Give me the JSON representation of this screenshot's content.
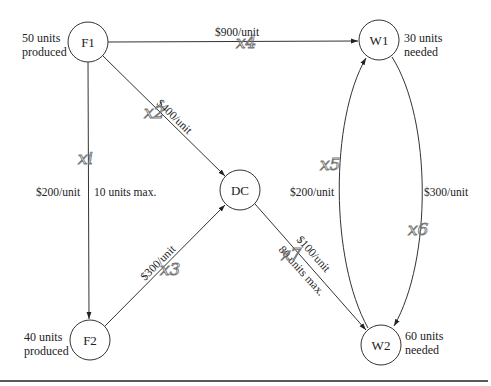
{
  "diagram": {
    "type": "transportation-network",
    "nodes": [
      {
        "id": "F1",
        "label": "F1",
        "cx": 88,
        "cy": 42,
        "note_line1": "50 units",
        "note_line2": "produced"
      },
      {
        "id": "F2",
        "label": "F2",
        "cx": 90,
        "cy": 340,
        "note_line1": "40 units",
        "note_line2": "produced"
      },
      {
        "id": "DC",
        "label": "DC",
        "cx": 240,
        "cy": 190
      },
      {
        "id": "W1",
        "label": "W1",
        "cx": 379,
        "cy": 40,
        "note_line1": "30 units",
        "note_line2": "needed"
      },
      {
        "id": "W2",
        "label": "W2",
        "cx": 381,
        "cy": 345,
        "note_line1": "60 units",
        "note_line2": "needed"
      }
    ],
    "edges": [
      {
        "from": "F1",
        "to": "W1",
        "cost": "$900/unit",
        "variable": "x4"
      },
      {
        "from": "F1",
        "to": "DC",
        "cost": "$400/unit",
        "variable": "x2"
      },
      {
        "from": "F1",
        "to": "F2",
        "cost": "$200/unit",
        "capacity": "10 units max.",
        "variable": "x1"
      },
      {
        "from": "F2",
        "to": "DC",
        "cost": "$300/unit",
        "variable": "x3"
      },
      {
        "from": "DC",
        "to": "W2",
        "cost": "$100/unit",
        "capacity": "80 units max.",
        "variable": "x7"
      },
      {
        "from": "W2",
        "to": "W1",
        "cost": "$200/unit",
        "variable": "x5"
      },
      {
        "from": "W1",
        "to": "W2",
        "cost": "$300/unit",
        "variable": "x6"
      }
    ],
    "handwritten": {
      "x1": "xi",
      "x2": "x2",
      "x3": "x3",
      "x4": "x4",
      "x5": "x5",
      "x6": "x6",
      "x7": "x7"
    }
  },
  "labels": {
    "f1": "F1",
    "f2": "F2",
    "dc": "DC",
    "w1": "W1",
    "w2": "W2",
    "f1_note_1": "50 units",
    "f1_note_2": "produced",
    "f2_note_1": "40 units",
    "f2_note_2": "produced",
    "w1_note_1": "30 units",
    "w1_note_2": "needed",
    "w2_note_1": "60 units",
    "w2_note_2": "needed",
    "f1_w1_cost": "$900/unit",
    "f1_dc_cost": "$400/unit",
    "f1_f2_cost": "$200/unit",
    "f1_f2_cap": "10 units max.",
    "f2_dc_cost": "$300/unit",
    "dc_w2_cost": "$100/unit",
    "dc_w2_cap": "80 units max.",
    "w2_w1_cost": "$200/unit",
    "w1_w2_cost": "$300/unit",
    "hw_x1": "xi",
    "hw_x2": "x2",
    "hw_x3": "x3",
    "hw_x4": "x4",
    "hw_x5": "x5",
    "hw_x6": "x6",
    "hw_x7": "x7"
  }
}
